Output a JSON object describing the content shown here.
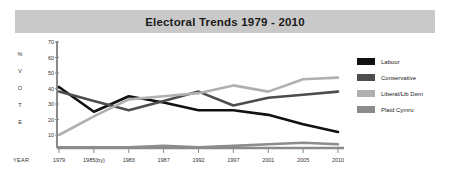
{
  "header": {
    "title": "Electoral Trends 1979 - 2010",
    "band_color": "#c9c9c9"
  },
  "axis": {
    "vertical_caption_letters": [
      "%",
      "V",
      "O",
      "T",
      "E"
    ],
    "year_caption": "YEAR"
  },
  "legend": {
    "position": "right",
    "items": [
      {
        "label": "Labour",
        "color": "#111111"
      },
      {
        "label": "Conservative",
        "color": "#4d4d4d"
      },
      {
        "label": "Liberal/Lib Dem",
        "color": "#b0b0b0"
      },
      {
        "label": "Plaid Cymru",
        "color": "#8c8c8c"
      }
    ]
  },
  "chart_data": {
    "type": "line",
    "title": "Electoral Trends 1979 - 2010",
    "xlabel": "YEAR",
    "ylabel": "% VOTE",
    "ylim": [
      0,
      70
    ],
    "yticks": [
      10,
      20,
      30,
      40,
      50,
      60,
      70
    ],
    "grid": false,
    "legend_position": "right",
    "categories": [
      "1979",
      "1985(by)",
      "1983",
      "1987",
      "1992",
      "1997",
      "2001",
      "2005",
      "2010"
    ],
    "series": [
      {
        "name": "Labour",
        "color": "#111111",
        "values": [
          41,
          25,
          35,
          31,
          26,
          26,
          23,
          17,
          12
        ]
      },
      {
        "name": "Conservative",
        "color": "#4d4d4d",
        "values": [
          38,
          32,
          26,
          32,
          38,
          29,
          34,
          36,
          38
        ]
      },
      {
        "name": "Liberal/Lib Dem",
        "color": "#b0b0b0",
        "values": [
          10,
          22,
          33,
          35,
          37,
          42,
          38,
          46,
          47
        ]
      },
      {
        "name": "Plaid Cymru",
        "color": "#8c8c8c",
        "values": [
          2,
          2,
          2,
          3,
          2,
          3,
          4,
          5,
          4
        ]
      }
    ]
  }
}
